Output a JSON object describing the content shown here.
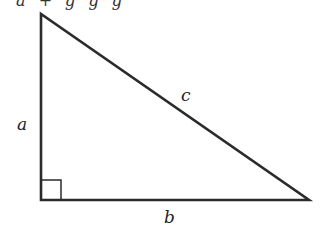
{
  "figure": {
    "top_caption_fragment": "a + g  g  g",
    "shape": "right-triangle",
    "labels": {
      "leg_vertical": "a",
      "leg_horizontal": "b",
      "hypotenuse": "c"
    },
    "right_angle_marker": true,
    "stroke_color": "#2b2b2b"
  }
}
